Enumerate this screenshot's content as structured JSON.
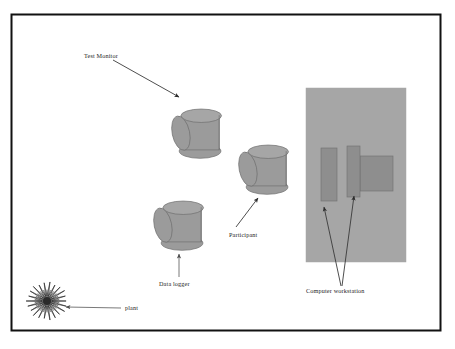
{
  "figure": {
    "kind": "experiment-room-layout-diagram",
    "background_color": "#ffffff",
    "frame": {
      "stroke_color": "#111111",
      "fill_color": "#ffffff",
      "x": 11,
      "y": 14,
      "width": 429,
      "height": 316
    },
    "palette": {
      "object_fill": "#9b9b9b",
      "object_fill_light": "#a6a6a6",
      "object_fill_dark": "#8e8e8e",
      "object_stroke": "#6f6f6f",
      "arrow_color": "#2b2b2b",
      "arrow_color_light": "#6d6d6d",
      "label_color": "#1c1c1c",
      "plant_color": "#2a2a2a"
    }
  },
  "labels": {
    "test_monitor": "Test Monitor",
    "participant": "Participant",
    "data_logger": "Data logger",
    "computer_workstation": "Computer workstation",
    "plant": "plant"
  },
  "objects": {
    "cylinders": [
      {
        "name": "test-monitor-cylinder",
        "cx": 196,
        "cy": 132,
        "w": 58,
        "h": 56
      },
      {
        "name": "participant-cylinder",
        "cx": 263,
        "cy": 168,
        "w": 58,
        "h": 56
      },
      {
        "name": "data-logger-cylinder",
        "cx": 178,
        "cy": 224,
        "w": 58,
        "h": 56
      }
    ],
    "workstation_desk": {
      "name": "workstation-desk",
      "x": 306,
      "y": 88,
      "width": 100,
      "height": 174
    },
    "workstation_monitors": [
      {
        "name": "monitor-left",
        "x": 321,
        "y": 148,
        "width": 16,
        "height": 53
      },
      {
        "name": "monitor-middle",
        "x": 347,
        "y": 146,
        "width": 13,
        "height": 51
      },
      {
        "name": "monitor-right",
        "x": 360,
        "y": 156,
        "width": 33,
        "height": 35
      }
    ],
    "plant": {
      "name": "plant-burst",
      "cx": 47,
      "cy": 301,
      "outer_r": 20,
      "inner_r": 5,
      "spikes": 22
    }
  },
  "arrows": [
    {
      "name": "arrow-test-monitor",
      "from_x": 113,
      "from_y": 60,
      "to_x": 179,
      "to_y": 97,
      "color": "#3a3a3a"
    },
    {
      "name": "arrow-participant",
      "from_x": 236,
      "from_y": 227,
      "to_x": 258,
      "to_y": 198,
      "color": "#3a3a3a"
    },
    {
      "name": "arrow-data-logger",
      "from_x": 179,
      "from_y": 277,
      "to_x": 179,
      "to_y": 254,
      "color": "#6a6a6a"
    },
    {
      "name": "arrow-workstation-left",
      "from_x": 341,
      "from_y": 286,
      "to_x": 324,
      "to_y": 207,
      "color": "#3a3a3a"
    },
    {
      "name": "arrow-workstation-right",
      "from_x": 342,
      "from_y": 286,
      "to_x": 354,
      "to_y": 196,
      "color": "#3a3a3a"
    },
    {
      "name": "arrow-plant",
      "from_x": 121,
      "from_y": 308,
      "to_x": 66,
      "to_y": 307,
      "color": "#6a6a6a"
    }
  ]
}
